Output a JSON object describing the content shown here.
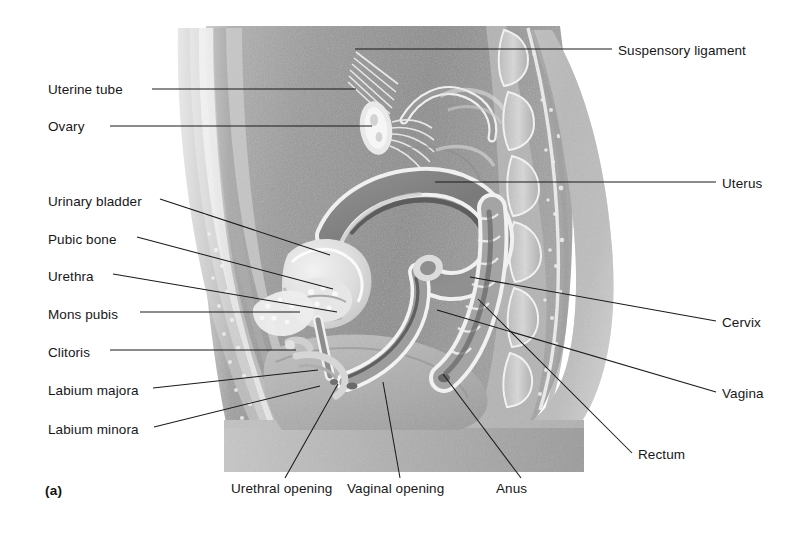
{
  "figure": {
    "caption": "(a)",
    "background": "#ffffff",
    "ink": "#1a1a1a",
    "style": "grayscale halftone medical illustration"
  },
  "labels_left": [
    {
      "text": "Uterine tube",
      "x": 57,
      "y": 92,
      "anchor_x": 152,
      "anchor_y": 92,
      "target_x": 356,
      "target_y": 92
    },
    {
      "text": "Ovary",
      "x": 57,
      "y": 129,
      "anchor_x": 110,
      "anchor_y": 129,
      "target_x": 372,
      "target_y": 128
    },
    {
      "text": "Urinary bladder",
      "x": 48,
      "y": 204,
      "anchor_x": 160,
      "anchor_y": 202,
      "target_x": 330,
      "target_y": 255
    },
    {
      "text": "Pubic bone",
      "x": 48,
      "y": 242,
      "anchor_x": 137,
      "anchor_y": 240,
      "target_x": 333,
      "target_y": 289
    },
    {
      "text": "Urethra",
      "x": 48,
      "y": 279,
      "anchor_x": 113,
      "anchor_y": 277,
      "target_x": 337,
      "target_y": 312
    },
    {
      "text": "Mons pubis",
      "x": 48,
      "y": 317,
      "anchor_x": 140,
      "anchor_y": 315,
      "target_x": 300,
      "target_y": 315
    },
    {
      "text": "Clitoris",
      "x": 48,
      "y": 355,
      "anchor_x": 110,
      "anchor_y": 353,
      "target_x": 296,
      "target_y": 353
    },
    {
      "text": "Labium majora",
      "x": 48,
      "y": 393,
      "anchor_x": 153,
      "anchor_y": 391,
      "target_x": 318,
      "target_y": 372
    },
    {
      "text": "Labium minora",
      "x": 48,
      "y": 432,
      "anchor_x": 154,
      "anchor_y": 430,
      "target_x": 320,
      "target_y": 388
    }
  ],
  "labels_right": [
    {
      "text": "Suspensory ligament",
      "x": 618,
      "y": 53,
      "anchor_x": 612,
      "anchor_y": 52,
      "target_x": 355,
      "target_y": 52
    },
    {
      "text": "Uterus",
      "x": 722,
      "y": 186,
      "anchor_x": 716,
      "anchor_y": 185,
      "target_x": 435,
      "target_y": 185
    },
    {
      "text": "Cervix",
      "x": 722,
      "y": 325,
      "anchor_x": 716,
      "anchor_y": 324,
      "target_x": 470,
      "target_y": 277
    },
    {
      "text": "Vagina",
      "x": 722,
      "y": 396,
      "anchor_x": 716,
      "anchor_y": 395,
      "target_x": 437,
      "target_y": 310
    },
    {
      "text": "Rectum",
      "x": 638,
      "y": 457,
      "anchor_x": 632,
      "anchor_y": 456,
      "target_x": 478,
      "target_y": 299
    }
  ],
  "labels_bottom": [
    {
      "text": "Urethral opening",
      "x": 231,
      "y": 491,
      "anchor_x": 285,
      "anchor_y": 478,
      "target_x": 338,
      "target_y": 382
    },
    {
      "text": "Vaginal opening",
      "x": 347,
      "y": 491,
      "anchor_x": 400,
      "anchor_y": 478,
      "target_x": 383,
      "target_y": 380
    },
    {
      "text": "Anus",
      "x": 496,
      "y": 491,
      "anchor_x": 521,
      "anchor_y": 478,
      "target_x": 443,
      "target_y": 372
    }
  ]
}
